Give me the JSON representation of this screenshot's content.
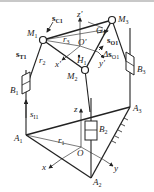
{
  "diagram": {
    "type": "parallel-mechanism-schematic",
    "colors": {
      "line": "#222222",
      "background": "#ffffff",
      "topbar": "#c8c8c8"
    },
    "points": {
      "M1": {
        "name": "M",
        "sub": "1"
      },
      "M2": {
        "name": "M",
        "sub": "2"
      },
      "M3": {
        "name": "M",
        "sub": "3"
      },
      "A1": {
        "name": "A",
        "sub": "1"
      },
      "A2": {
        "name": "A",
        "sub": "2"
      },
      "A3": {
        "name": "A",
        "sub": "3"
      },
      "O": {
        "name": "O"
      },
      "Op": {
        "name": "O'"
      },
      "G1": {
        "name": "G",
        "sub": "1"
      },
      "H1": {
        "name": "H",
        "sub": "1"
      }
    },
    "sliders": {
      "B1": {
        "name": "B",
        "sub": "1"
      },
      "B2": {
        "name": "B",
        "sub": "2"
      },
      "B3": {
        "name": "B",
        "sub": "3"
      }
    },
    "axes": {
      "x": "x",
      "y": "y",
      "z": "z",
      "xp": "x'",
      "yp": "y'",
      "zp": "z'"
    },
    "radii": {
      "r1": {
        "name": "r",
        "sub": "1"
      },
      "r2": {
        "name": "r",
        "sub": "2"
      },
      "r3": {
        "name": "r",
        "sub": "3"
      }
    },
    "vectors": {
      "sC1": {
        "name": "s",
        "sub": "C1"
      },
      "sT1": {
        "name": "s",
        "sub": "T1"
      },
      "sO1": {
        "name": "s",
        "sub": "O1"
      },
      "dsO1": {
        "prefix": "Δ",
        "name": "s",
        "sub": "O1"
      },
      "sI1": {
        "name": "s",
        "sub": "I1"
      }
    }
  }
}
